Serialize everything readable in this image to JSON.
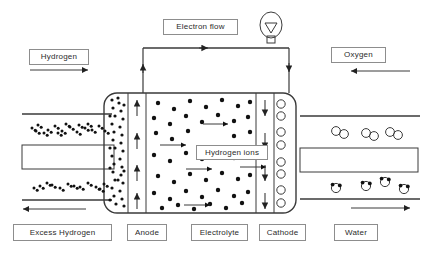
{
  "diagram": {
    "colors": {
      "stroke": "#3a3a3a",
      "label_border": "#8d8d8d",
      "label_text": "#2b2b2b",
      "background": "#ffffff",
      "particle": "#111111"
    }
  },
  "labels": {
    "hydrogen": "Hydrogen",
    "electron_flow": "Electron flow",
    "oxygen": "Oxygen",
    "hydrogen_ions": "Hydrogen ions",
    "excess_hydrogen": "Excess Hydrogen",
    "anode": "Anode",
    "electrolyte": "Electrolyte",
    "cathode": "Cathode",
    "water": "Water"
  },
  "label_boxes": [
    {
      "key": "hydrogen",
      "name": "label-hydrogen",
      "x": 29,
      "y": 49,
      "w": 60,
      "h": 16
    },
    {
      "key": "electron_flow",
      "name": "label-electron-flow",
      "x": 163,
      "y": 19,
      "w": 75,
      "h": 16
    },
    {
      "key": "oxygen",
      "name": "label-oxygen",
      "x": 331,
      "y": 47,
      "w": 55,
      "h": 16
    },
    {
      "key": "hydrogen_ions",
      "name": "label-hydrogen-ions",
      "x": 196,
      "y": 145,
      "w": 72,
      "h": 15
    },
    {
      "key": "excess_hydrogen",
      "name": "label-excess-hydrogen",
      "x": 13,
      "y": 224,
      "w": 99,
      "h": 17
    },
    {
      "key": "anode",
      "name": "label-anode",
      "x": 127,
      "y": 224,
      "w": 40,
      "h": 17
    },
    {
      "key": "electrolyte",
      "name": "label-electrolyte",
      "x": 191,
      "y": 224,
      "w": 57,
      "h": 17
    },
    {
      "key": "cathode",
      "name": "label-cathode",
      "x": 259,
      "y": 224,
      "w": 47,
      "h": 17
    },
    {
      "key": "water",
      "name": "label-water",
      "x": 334,
      "y": 224,
      "w": 44,
      "h": 17
    }
  ],
  "cell": {
    "body_x": 104,
    "body_y": 93,
    "body_w": 192,
    "body_h": 120,
    "corner_radius": 13,
    "anode_x1": 128,
    "anode_x2": 146,
    "cathode_x1": 256,
    "cathode_x2": 274,
    "electrolyte_x1": 146,
    "electrolyte_x2": 256
  },
  "flow_arrows": [
    {
      "name": "arrow-hydrogen-in",
      "direction": "right",
      "x1": 30,
      "x2": 88,
      "y": 70
    },
    {
      "name": "arrow-oxygen-in",
      "direction": "left",
      "x1": 351,
      "x2": 410,
      "y": 71
    },
    {
      "name": "arrow-excess-hydrogen-out",
      "direction": "left",
      "x1": 23,
      "x2": 86,
      "y": 209
    },
    {
      "name": "arrow-water-out",
      "direction": "right",
      "x1": 351,
      "x2": 410,
      "y": 208
    }
  ],
  "circuit": {
    "name": "electron-circuit",
    "left_wire_x": 143,
    "right_wire_x": 289,
    "top_wire_y": 48,
    "bulb_cx": 271,
    "bulb_cy": 25,
    "bulb_r": 13,
    "arrow_up_y": 64,
    "arrow_right_x": 208,
    "arrow_down_y": 72
  },
  "ion_arrows_electrolyte": [
    {
      "x1": 203,
      "x2": 228,
      "y": 124
    },
    {
      "x1": 160,
      "x2": 186,
      "y": 145
    },
    {
      "x1": 186,
      "x2": 212,
      "y": 169
    },
    {
      "x1": 240,
      "x2": 266,
      "y": 167
    },
    {
      "x1": 184,
      "x2": 210,
      "y": 205
    }
  ],
  "anode_arrows_up": [
    {
      "x": 137,
      "y1": 116,
      "y2": 100
    },
    {
      "x": 137,
      "y1": 149,
      "y2": 133
    },
    {
      "x": 137,
      "y1": 181,
      "y2": 165
    },
    {
      "x": 137,
      "y1": 209,
      "y2": 193
    }
  ],
  "cathode_arrows_down": [
    {
      "x": 265,
      "y1": 100,
      "y2": 116
    },
    {
      "x": 265,
      "y1": 133,
      "y2": 149
    },
    {
      "x": 265,
      "y1": 165,
      "y2": 181
    },
    {
      "x": 265,
      "y1": 193,
      "y2": 209
    }
  ],
  "channels_left": [
    {
      "name": "hydrogen-inlet-upper",
      "y": 114,
      "x1": 22,
      "x2": 112
    },
    {
      "name": "hydrogen-inlet-lower",
      "y": 200,
      "x1": 22,
      "x2": 112
    }
  ],
  "channel_block_left": {
    "x": 22,
    "y": 145,
    "w": 92,
    "h": 24
  },
  "channels_right": [
    {
      "name": "oxygen-inlet-upper",
      "y": 116,
      "x1": 300,
      "x2": 420
    },
    {
      "name": "water-outlet-lower",
      "y": 199,
      "x1": 300,
      "x2": 420
    }
  ],
  "channel_block_right": {
    "x": 300,
    "y": 148,
    "w": 118,
    "h": 24
  },
  "particles": {
    "hydrogen_dots_upper": [
      [
        32,
        128
      ],
      [
        38,
        125
      ],
      [
        48,
        130
      ],
      [
        55,
        126
      ],
      [
        62,
        131
      ],
      [
        70,
        127
      ],
      [
        77,
        132
      ],
      [
        85,
        128
      ],
      [
        92,
        130
      ],
      [
        99,
        126
      ],
      [
        44,
        133
      ],
      [
        66,
        124
      ],
      [
        88,
        124
      ],
      [
        105,
        131
      ],
      [
        58,
        133
      ],
      [
        79,
        125
      ],
      [
        36,
        131
      ]
    ],
    "hydrogen_dots_lower": [
      [
        40,
        186
      ],
      [
        47,
        183
      ],
      [
        60,
        188
      ],
      [
        68,
        184
      ],
      [
        80,
        187
      ],
      [
        88,
        183
      ],
      [
        96,
        187
      ],
      [
        104,
        184
      ],
      [
        52,
        185
      ],
      [
        74,
        186
      ],
      [
        34,
        188
      ],
      [
        100,
        189
      ]
    ],
    "anode_dense_dots": [
      [
        112,
        100
      ],
      [
        119,
        103
      ],
      [
        113,
        108
      ],
      [
        121,
        111
      ],
      [
        115,
        116
      ],
      [
        123,
        119
      ],
      [
        112,
        124
      ],
      [
        120,
        127
      ],
      [
        114,
        132
      ],
      [
        122,
        135
      ],
      [
        113,
        140
      ],
      [
        121,
        143
      ],
      [
        115,
        148
      ],
      [
        123,
        151
      ],
      [
        112,
        156
      ],
      [
        120,
        159
      ],
      [
        114,
        164
      ],
      [
        122,
        167
      ],
      [
        113,
        172
      ],
      [
        121,
        175
      ],
      [
        115,
        180
      ],
      [
        123,
        183
      ],
      [
        112,
        188
      ],
      [
        120,
        191
      ],
      [
        114,
        196
      ],
      [
        122,
        199
      ],
      [
        116,
        204
      ],
      [
        124,
        206
      ],
      [
        110,
        116
      ],
      [
        118,
        98
      ],
      [
        110,
        148
      ],
      [
        118,
        180
      ],
      [
        110,
        168
      ],
      [
        124,
        105
      ],
      [
        124,
        171
      ],
      [
        110,
        200
      ]
    ],
    "electrolyte_dots": [
      [
        158,
        103
      ],
      [
        174,
        109
      ],
      [
        190,
        101
      ],
      [
        206,
        107
      ],
      [
        222,
        100
      ],
      [
        238,
        106
      ],
      [
        250,
        102
      ],
      [
        154,
        118
      ],
      [
        170,
        124
      ],
      [
        186,
        116
      ],
      [
        202,
        122
      ],
      [
        218,
        115
      ],
      [
        234,
        121
      ],
      [
        248,
        117
      ],
      [
        156,
        133
      ],
      [
        172,
        139
      ],
      [
        188,
        131
      ],
      [
        234,
        136
      ],
      [
        250,
        132
      ],
      [
        154,
        155
      ],
      [
        170,
        161
      ],
      [
        186,
        153
      ],
      [
        202,
        159
      ],
      [
        218,
        152
      ],
      [
        234,
        158
      ],
      [
        248,
        154
      ],
      [
        158,
        176
      ],
      [
        174,
        182
      ],
      [
        190,
        174
      ],
      [
        206,
        180
      ],
      [
        222,
        173
      ],
      [
        238,
        179
      ],
      [
        250,
        175
      ],
      [
        154,
        193
      ],
      [
        170,
        199
      ],
      [
        186,
        191
      ],
      [
        202,
        197
      ],
      [
        218,
        190
      ],
      [
        234,
        196
      ],
      [
        248,
        192
      ],
      [
        162,
        208
      ],
      [
        178,
        205
      ],
      [
        194,
        209
      ],
      [
        210,
        204
      ],
      [
        226,
        208
      ],
      [
        242,
        203
      ]
    ],
    "oxygen_pairs_cathode": [
      [
        281,
        104
      ],
      [
        281,
        116
      ],
      [
        281,
        132
      ],
      [
        281,
        145
      ],
      [
        281,
        162
      ],
      [
        281,
        174
      ],
      [
        281,
        190
      ],
      [
        281,
        203
      ]
    ],
    "oxygen_pairs_channel": [
      {
        "x": 336,
        "y": 131
      },
      {
        "x": 366,
        "y": 133
      },
      {
        "x": 390,
        "y": 132
      }
    ],
    "water_molecules": [
      {
        "x": 336,
        "y": 188
      },
      {
        "x": 366,
        "y": 186
      },
      {
        "x": 385,
        "y": 182
      },
      {
        "x": 404,
        "y": 189
      }
    ]
  }
}
